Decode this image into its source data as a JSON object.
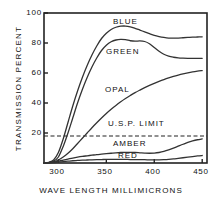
{
  "chart_data": {
    "type": "line",
    "title": "",
    "xlabel": "WAVE LENGTH MILLIMICRONS",
    "ylabel": "TRANSMISSION PERCENT",
    "xlim": [
      285,
      455
    ],
    "ylim": [
      0,
      100
    ],
    "xticks": [
      300,
      350,
      400,
      450
    ],
    "yticks": [
      0,
      20,
      40,
      60,
      80,
      100
    ],
    "xtick_labels": [
      "300",
      "350",
      "400",
      "450"
    ],
    "ytick_labels": [
      "20",
      "40",
      "60",
      "80",
      "100"
    ],
    "grid": false,
    "legend": "inline-annotations",
    "annotations": [
      {
        "name": "blue-label",
        "text": "BLUE",
        "x": 368,
        "y": 95
      },
      {
        "name": "green-label",
        "text": "GREEN",
        "x": 360,
        "y": 74
      },
      {
        "name": "opal-label",
        "text": "OPAL",
        "x": 355,
        "y": 44
      },
      {
        "name": "usp-limit-label",
        "text": "U.S.P. LIMIT",
        "x": 372,
        "y": 23
      },
      {
        "name": "amber-label",
        "text": "AMBER",
        "x": 368,
        "y": 12
      },
      {
        "name": "red-label",
        "text": "RED",
        "x": 370,
        "y": 5
      }
    ],
    "reference_line": {
      "name": "U.S.P. LIMIT",
      "value": 18,
      "style": "dashed",
      "orientation": "horizontal"
    },
    "x": [
      285,
      290,
      295,
      300,
      305,
      310,
      315,
      320,
      325,
      330,
      335,
      340,
      345,
      350,
      355,
      360,
      365,
      370,
      375,
      380,
      385,
      390,
      395,
      400,
      405,
      410,
      415,
      420,
      425,
      430,
      435,
      440,
      445,
      450
    ],
    "series": [
      {
        "name": "BLUE",
        "color": "#333333",
        "values": [
          0,
          0.5,
          2,
          7,
          16,
          27,
          38,
          48,
          57,
          65,
          72,
          78,
          83,
          86.5,
          89,
          90.5,
          91.2,
          91.3,
          90.8,
          89.8,
          88.6,
          87.4,
          86.2,
          85.1,
          84.3,
          83.7,
          83.3,
          83.2,
          83.3,
          83.5,
          83.7,
          83.9,
          84.0,
          84.1
        ]
      },
      {
        "name": "GREEN",
        "color": "#333333",
        "values": [
          0,
          0.3,
          1.2,
          4,
          11,
          20,
          30,
          40,
          49,
          57,
          64,
          70,
          75,
          78.5,
          80.8,
          82.0,
          82.4,
          82.2,
          81.5,
          81.2,
          81.4,
          81.0,
          79.5,
          77.0,
          74.5,
          72.5,
          71.2,
          70.5,
          70.1,
          69.9,
          69.8,
          69.8,
          69.8,
          69.8
        ]
      },
      {
        "name": "OPAL",
        "color": "#333333",
        "values": [
          0,
          0.2,
          0.8,
          2,
          4,
          6.5,
          9.5,
          13,
          16.5,
          20,
          23.5,
          26.8,
          30,
          33,
          35.8,
          38.4,
          40.8,
          43,
          45,
          46.9,
          48.6,
          50.2,
          51.7,
          53.1,
          54.4,
          55.6,
          56.7,
          57.7,
          58.6,
          59.4,
          60.1,
          60.7,
          61.2,
          61.6
        ]
      },
      {
        "name": "AMBER",
        "color": "#333333",
        "values": [
          0,
          0.2,
          0.6,
          1.2,
          1.9,
          2.6,
          3.3,
          3.9,
          4.4,
          4.8,
          5.2,
          5.6,
          5.9,
          6.2,
          6.5,
          6.8,
          7.0,
          7.1,
          7.1,
          7.0,
          6.8,
          6.6,
          6.5,
          6.6,
          7.0,
          7.7,
          8.7,
          9.9,
          11.2,
          12.5,
          13.7,
          14.7,
          15.5,
          16.1
        ]
      },
      {
        "name": "RED",
        "color": "#333333",
        "values": [
          0,
          0.1,
          0.3,
          0.6,
          0.9,
          1.2,
          1.5,
          1.7,
          1.9,
          2.0,
          2.1,
          2.2,
          2.3,
          2.4,
          2.4,
          2.4,
          2.4,
          2.4,
          2.3,
          2.3,
          2.2,
          2.2,
          2.1,
          2.1,
          2.1,
          2.2,
          2.4,
          2.7,
          3.1,
          3.5,
          3.9,
          4.3,
          4.7,
          5.0
        ]
      }
    ]
  },
  "axes": {
    "y_labels": [
      "100",
      "80",
      "60",
      "40",
      "20"
    ],
    "x_labels": [
      "300",
      "350",
      "400",
      "450"
    ],
    "y_title": "TRANSMISSION  PERCENT",
    "x_title": "WAVE  LENGTH  MILLIMICRONS"
  },
  "labels": {
    "blue": "BLUE",
    "green": "GREEN",
    "opal": "OPAL",
    "usp": "U.S.P.  LIMIT",
    "amber": "AMBER",
    "red": "RED"
  }
}
